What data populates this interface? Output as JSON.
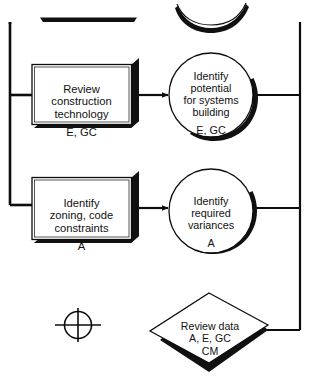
{
  "diagram": {
    "ink_color": "#0d0d0d",
    "shadow_color": "#111111",
    "background": "#ffffff",
    "nodes": {
      "process_review_construction": {
        "shape": "rectangle",
        "text": "Review\nconstruction\ntechnology",
        "roles": "E, GC"
      },
      "decision_identify_potential": {
        "shape": "circle",
        "text": "Identify\npotential\nfor systems\nbuilding",
        "roles": "E, GC"
      },
      "process_identify_zoning": {
        "shape": "rectangle",
        "text": "Identify\nzoning, code\nconstraints",
        "roles": "A"
      },
      "decision_identify_variances": {
        "shape": "circle",
        "text": "Identify\nrequired\nvariances",
        "roles": "A"
      },
      "review_data": {
        "shape": "diamond",
        "text": "Review data",
        "roles": "A, E, GC\nCM"
      },
      "junction_marker": {
        "shape": "crosshair",
        "text": ""
      }
    },
    "partial_shapes_top": {
      "clipped_rectangle_shadow": "rectangle bottom shadow from row above",
      "clipped_circle_shadow": "circle bottom shadow from row above"
    },
    "connectors": {
      "left_bus": "vertical distribution line on left edge",
      "right_bus": "vertical collection line on right edge",
      "box_to_circle_arrows": 2
    }
  }
}
